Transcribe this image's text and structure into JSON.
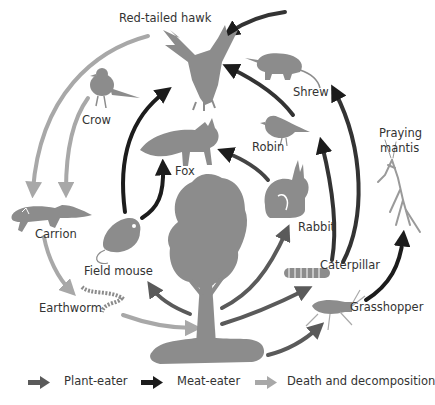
{
  "diagram": {
    "organisms": {
      "hawk": "Red-tailed hawk",
      "crow": "Crow",
      "fox": "Fox",
      "shrew": "Shrew",
      "robin": "Robin",
      "rabbit": "Rabbit",
      "mantis_line1": "Praying",
      "mantis_line2": "mantis",
      "carrion": "Carrion",
      "field_mouse": "Field mouse",
      "caterpillar": "Caterpillar",
      "grasshopper": "Grasshopper",
      "earthworm": "Earthworm",
      "tree": "Tree"
    },
    "legend": [
      {
        "label": "Plant-eater",
        "color": "#5a5a5a"
      },
      {
        "label": "Meat-eater",
        "color": "#1c1c1c"
      },
      {
        "label": "Death and decomposition",
        "color": "#a8a8a8"
      }
    ],
    "colors": {
      "silhouette": "#8c8c8c",
      "plant_eater": "#5a5a5a",
      "meat_eater": "#1c1c1c",
      "decomposition": "#a8a8a8"
    }
  }
}
